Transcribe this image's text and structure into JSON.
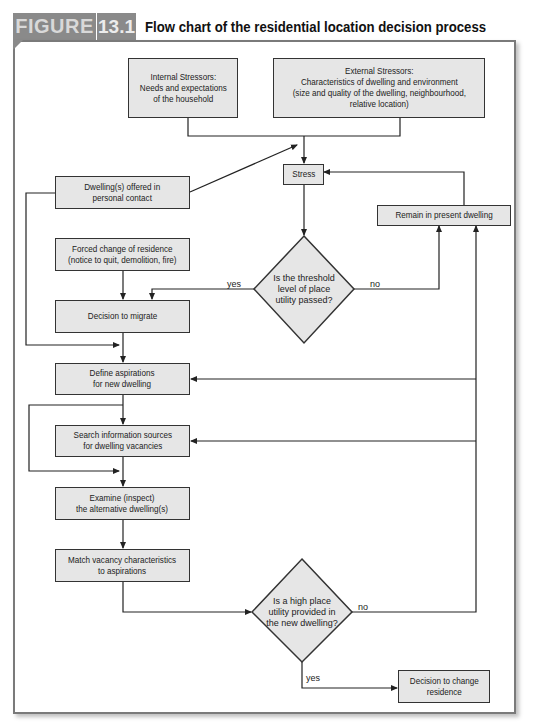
{
  "header": {
    "figure_label": "FIGURE",
    "figure_number": "13.1",
    "title": "Flow chart of the residential location decision process"
  },
  "nodes": {
    "internal_stressors": "Internal Stressors:\nNeeds and expectations\nof the household",
    "external_stressors": "External Stressors:\nCharacteristics of dwelling and environment\n(size and quality of the dwelling, neighbourhood,\nrelative location)",
    "stress": "Stress",
    "dwelling_offered": "Dwelling(s) offered in\npersonal contact",
    "remain_present": "Remain in present dwelling",
    "forced_change": "Forced change of residence\n(notice to quit, demolition, fire)",
    "threshold_decision": "Is the threshold\nlevel of place\nutility passed?",
    "decision_migrate": "Decision to migrate",
    "define_aspirations": "Define aspirations\nfor new dwelling",
    "search_sources": "Search information sources\nfor dwelling vacancies",
    "examine_alternatives": "Examine (inspect)\nthe alternative dwelling(s)",
    "match_vacancy": "Match vacancy characteristics\nto aspirations",
    "high_utility_decision": "Is a high place\nutility provided in\nthe new dwelling?",
    "decision_change": "Decision to change\nresidence"
  },
  "edge_labels": {
    "threshold_yes": "yes",
    "threshold_no": "no",
    "high_utility_no": "no",
    "high_utility_yes": "yes"
  },
  "colors": {
    "box_fill": "#e6e6e6",
    "box_border": "#333333",
    "header_tab": "#8a8a8a",
    "card_border": "#7a7a7a"
  }
}
